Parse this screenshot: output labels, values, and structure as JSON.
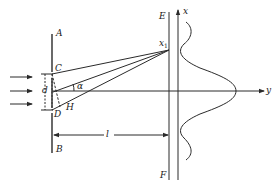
{
  "diagram": {
    "type": "double-slit interference",
    "labels": {
      "A": "A",
      "B": "B",
      "C": "C",
      "D": "D",
      "H": "H",
      "E": "E",
      "F": "F",
      "d": "d",
      "alpha": "α",
      "l": "l",
      "x_axis": "x",
      "y_axis": "y",
      "x1_base": "x",
      "x1_sub": "1"
    },
    "colors": {
      "stroke": "#2a2a2a",
      "background": "#ffffff"
    },
    "incident_arrows": 3
  }
}
